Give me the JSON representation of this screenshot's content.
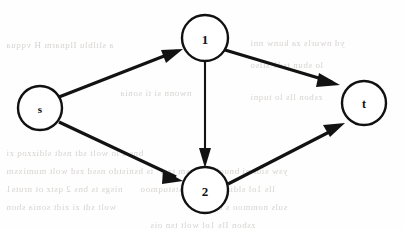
{
  "diagram": {
    "background_color": "#fefefe",
    "stroke_color": "#121212",
    "node_fill_color": "#ffffff",
    "ghost_text_color": "#c9c6c2"
  },
  "nodes": [
    {
      "id": "s",
      "label": "s",
      "cx": 40,
      "cy": 108,
      "r": 22
    },
    {
      "id": "1",
      "label": "1",
      "cx": 205,
      "cy": 38,
      "r": 23
    },
    {
      "id": "2",
      "label": "2",
      "cx": 205,
      "cy": 190,
      "r": 23
    },
    {
      "id": "t",
      "label": "t",
      "cx": 364,
      "cy": 103,
      "r": 22
    }
  ],
  "edges": [
    {
      "id": "s-1",
      "from": "s",
      "to": "1",
      "directed": true,
      "style": "thick"
    },
    {
      "id": "s-2",
      "from": "s",
      "to": "2",
      "directed": true,
      "style": "thick"
    },
    {
      "id": "1-t",
      "from": "1",
      "to": "t",
      "directed": true,
      "style": "thick"
    },
    {
      "id": "1-2",
      "from": "1",
      "to": "2",
      "directed": true,
      "style": "thin"
    },
    {
      "id": "2-t",
      "from": "2",
      "to": "t",
      "directed": true,
      "style": "thick"
    }
  ],
  "background_ghost_text": [
    {
      "text": "a  sltlblu  Ilqnarm  H  vqqua",
      "x": 6,
      "y": 40
    },
    {
      "text": "yd  nwurls  za  kunw  nni",
      "x": 250,
      "y": 38
    },
    {
      "text": "lo  sbun  tsd1  sllso",
      "x": 250,
      "y": 60
    },
    {
      "text": "nwonn  si  ti  sonia",
      "x": 120,
      "y": 88
    },
    {
      "text": "zsbon  lls  lo  tuqni",
      "x": 250,
      "y": 92
    },
    {
      "text": "bns  s  lo  wolt  sdt  nsdt  sldizzoq  zi",
      "x": 6,
      "y": 148
    },
    {
      "text": "ts  bsnistdo  nssd  zsd  wolt  mumixsm",
      "x": 6,
      "y": 166
    },
    {
      "text": "ysw  sidt  ni  bnuol  si  Iznsm  tzsl",
      "x": 160,
      "y": 166
    },
    {
      "text": "nisgs  ts  bns  2  qstz  ot  nruts1",
      "x": 6,
      "y": 184
    },
    {
      "text": "lls  1ol  sldizzoq  zs  znoitstuqmoo",
      "x": 140,
      "y": 184
    },
    {
      "text": "wolt  sdt  zi  zidt  sonia  sbon",
      "x": 6,
      "y": 202
    },
    {
      "text": "suls  nommoo  s  ot  lsups",
      "x": 190,
      "y": 202
    },
    {
      "text": "zsbon  Ils  1ol  wolt  tsn  ois",
      "x": 150,
      "y": 220
    }
  ]
}
